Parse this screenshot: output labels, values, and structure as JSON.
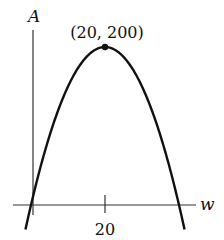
{
  "chart_data": {
    "type": "line",
    "title": "",
    "xlabel": "w",
    "ylabel": "A",
    "x_ticks": [
      20
    ],
    "x_tick_labels": [
      "20"
    ],
    "annotations": [
      {
        "x": 20,
        "y": 200,
        "text": "(20, 200)"
      }
    ],
    "series": [
      {
        "name": "A(w)",
        "function": "A = 20w - w^2/2 (parabola, vertex at (20, 200), zeros at w=0 and w=40)",
        "x": [
          0,
          5,
          10,
          15,
          20,
          25,
          30,
          35,
          40
        ],
        "y": [
          0,
          87.5,
          150,
          187.5,
          200,
          187.5,
          150,
          87.5,
          0
        ]
      }
    ],
    "xlim": [
      -1,
      45
    ],
    "ylim": [
      -40,
      230
    ],
    "grid": false,
    "legend": "none"
  },
  "labels": {
    "y_axis": "A",
    "x_axis": "w",
    "tick": "20",
    "vertex": "(20, 200)"
  }
}
